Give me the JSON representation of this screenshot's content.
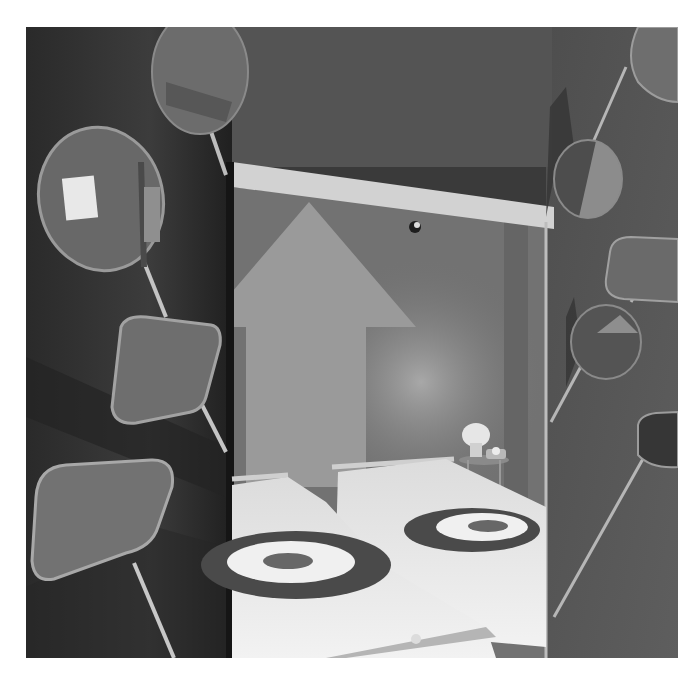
{
  "image": {
    "kind": "photograph",
    "mode": "grayscale",
    "subject": "hotel room viewed through doorway with wall-mounted paddle mirrors",
    "frame": {
      "left": 26,
      "top": 27,
      "width": 652,
      "height": 631,
      "border_color": "#ffffff"
    }
  },
  "palette": {
    "left_wall_dark": "#2c2c2c",
    "left_wall_mid": "#3e3e3e",
    "right_wall": "#5a5a5a",
    "doorframe": "#cfcfcf",
    "room_wall": "#747474",
    "arrow": "#9a9a9a",
    "bedding": "#ebebeb",
    "target_ring_dark": "#4a4a4a",
    "target_center": "#666666",
    "mirror_fill": "#6e6e6e",
    "mirror_rim": "#a8a8a8",
    "stem": "#b8b8b8",
    "lamp_glow": "#e6e6e6"
  },
  "objects": {
    "left_mirrors": [
      "oval-mirror-top",
      "round-mirror-reflecting-door",
      "rounded-rect-mirror",
      "rounded-rect-mirror-large"
    ],
    "right_mirrors": [
      "oval-mirror-top",
      "half-pie-disc",
      "rounded-rect-mirror",
      "pie-slice-disc",
      "dark-rounded-rect-mirror"
    ],
    "room": [
      "up-arrow-wall-graphic",
      "two-single-beds",
      "target-pattern-bedspreads",
      "bedside-lamp",
      "rotary-telephone",
      "round-side-table",
      "ceiling-spotlight"
    ]
  }
}
